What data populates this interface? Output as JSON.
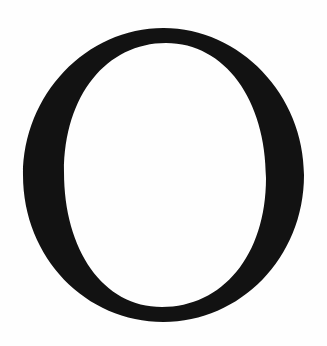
{
  "glyph": {
    "character": "O",
    "description": "Capital letter O in a serif typeface",
    "color": "#121212",
    "background": "#fefefe"
  }
}
